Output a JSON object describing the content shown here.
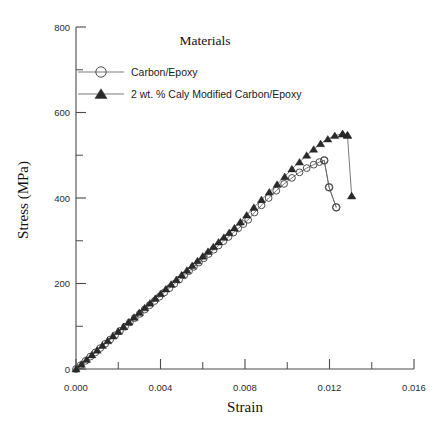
{
  "chart_data": {
    "type": "line",
    "title": "",
    "xlabel": "Strain",
    "ylabel": "Stress (MPa)",
    "xlim": [
      0.0,
      0.016
    ],
    "ylim": [
      0,
      800
    ],
    "grid": false,
    "legend_position": "upper-center",
    "legend_title": "Materials",
    "x_ticks_major": [
      "0.000",
      "0.004",
      "0.008",
      "0.012",
      "0.016"
    ],
    "x_tick_values": [
      0.0,
      0.004,
      0.008,
      0.012,
      0.016
    ],
    "x_ticks_minor_values": [
      0.002,
      0.006,
      0.01,
      0.014
    ],
    "y_ticks_major": [
      "0",
      "200",
      "400",
      "600",
      "800"
    ],
    "y_tick_values": [
      0,
      200,
      400,
      600,
      800
    ],
    "y_ticks_minor_values": [
      100,
      300,
      500,
      700
    ],
    "series": [
      {
        "name": "Carbon/Epoxy",
        "marker": "open-circle",
        "color": "#4f4f4f",
        "x": [
          0.0,
          0.00022,
          0.00045,
          0.00068,
          0.00092,
          0.00115,
          0.00138,
          0.00162,
          0.00185,
          0.00208,
          0.00232,
          0.00255,
          0.00278,
          0.00302,
          0.00325,
          0.00348,
          0.00372,
          0.00395,
          0.00418,
          0.00442,
          0.00465,
          0.00488,
          0.00512,
          0.00535,
          0.00558,
          0.00582,
          0.00605,
          0.00628,
          0.00652,
          0.00675,
          0.00698,
          0.00722,
          0.00745,
          0.00768,
          0.00792,
          0.00815,
          0.00845,
          0.00878,
          0.00912,
          0.00948,
          0.00985,
          0.01022,
          0.01058,
          0.01092,
          0.01125,
          0.01152,
          0.01175,
          0.01198,
          0.01232
        ],
        "y": [
          0,
          9,
          19,
          29,
          39,
          49,
          59,
          69,
          79,
          89,
          99,
          109,
          119,
          129,
          139,
          149,
          159,
          169,
          179,
          189,
          199,
          209,
          219,
          229,
          239,
          249,
          259,
          269,
          279,
          289,
          299,
          309,
          319,
          329,
          339,
          349,
          366,
          383,
          400,
          417,
          433,
          447,
          460,
          470,
          478,
          484,
          488,
          425,
          378
        ]
      },
      {
        "name": "2 wt. % Caly Modified Carbon/Epoxy",
        "marker": "filled-triangle",
        "color": "#2a2a2a",
        "x": [
          0.0,
          0.00025,
          0.0005,
          0.00075,
          0.001,
          0.00125,
          0.0015,
          0.00175,
          0.002,
          0.00225,
          0.0025,
          0.00275,
          0.003,
          0.00325,
          0.0035,
          0.00375,
          0.004,
          0.00425,
          0.0045,
          0.00475,
          0.005,
          0.00525,
          0.0055,
          0.00575,
          0.006,
          0.00625,
          0.0065,
          0.00675,
          0.007,
          0.00725,
          0.0075,
          0.00778,
          0.00808,
          0.00842,
          0.00878,
          0.00915,
          0.00952,
          0.00988,
          0.01022,
          0.01058,
          0.01092,
          0.01125,
          0.01158,
          0.01192,
          0.01225,
          0.01262,
          0.01285
        ],
        "y": [
          0,
          11,
          22,
          33,
          44,
          55,
          66,
          77,
          88,
          99,
          110,
          121,
          132,
          143,
          154,
          165,
          176,
          187,
          198,
          209,
          220,
          231,
          242,
          253,
          264,
          275,
          286,
          297,
          308,
          319,
          330,
          344,
          360,
          378,
          396,
          414,
          432,
          450,
          468,
          484,
          500,
          514,
          527,
          538,
          546,
          550,
          547
        ]
      }
    ],
    "carbon_epoxy_failure": {
      "peak_stress": 488,
      "peak_strain": 0.01175,
      "final_stress": 378,
      "final_strain": 0.01232
    },
    "clay_modified_failure": {
      "peak_stress": 550,
      "peak_strain": 0.01262,
      "final_stress": 405,
      "final_strain": 0.01305
    },
    "tail_carbon": {
      "x": [
        0.01175,
        0.01198,
        0.01232
      ],
      "y": [
        488,
        425,
        378
      ]
    },
    "tail_clay": {
      "x": [
        0.01262,
        0.01285,
        0.01305
      ],
      "y": [
        550,
        547,
        405
      ]
    }
  }
}
